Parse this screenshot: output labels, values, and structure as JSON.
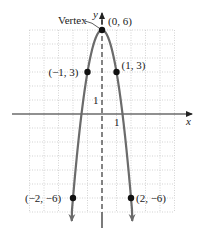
{
  "chart_data": {
    "type": "line",
    "title": "",
    "function": "y = -3x^2 + 6",
    "xlabel": "x",
    "ylabel": "y",
    "xlim": [
      -5,
      5
    ],
    "ylim": [
      -7,
      6
    ],
    "grid": true,
    "axis_of_symmetry": "x = 0 (dashed)",
    "tick_labels": {
      "x": "1",
      "y": "1"
    },
    "points": [
      {
        "x": -2,
        "y": -6,
        "label": "(−2, −6)"
      },
      {
        "x": -1,
        "y": 3,
        "label": "(−1, 3)"
      },
      {
        "x": 0,
        "y": 6,
        "label": "(0, 6)"
      },
      {
        "x": 1,
        "y": 3,
        "label": "(1, 3)"
      },
      {
        "x": 2,
        "y": -6,
        "label": "(2, −6)"
      }
    ],
    "annotations": [
      {
        "text": "Vertex",
        "points_to": [
          0,
          6
        ]
      }
    ],
    "colors": {
      "curve": "#6b6b6b",
      "grid": "#c8c8c8",
      "axis": "#222222",
      "point": "#111111"
    }
  }
}
